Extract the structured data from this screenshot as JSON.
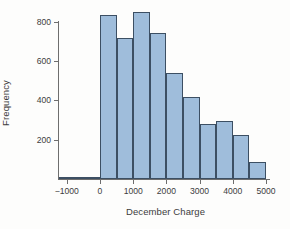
{
  "chart_data": {
    "type": "bar",
    "title": "",
    "subtitle": "",
    "xlabel": "December Charge",
    "ylabel": "Frequency",
    "xlim": [
      -1500,
      5200
    ],
    "ylim": [
      0,
      880
    ],
    "grid": false,
    "legend": null,
    "bin_width": 500,
    "xticks": [
      -1000,
      0,
      1000,
      2000,
      3000,
      4000,
      5000
    ],
    "xtick_labels": [
      "−1000",
      "0",
      "1000",
      "2000",
      "3000",
      "4000",
      "5000"
    ],
    "yticks": [
      200,
      400,
      600,
      800
    ],
    "ytick_labels": [
      "200",
      "400",
      "600",
      "800"
    ],
    "bin_edges": [
      -1250,
      -750,
      -250,
      0,
      500,
      1000,
      1500,
      2000,
      2500,
      3000,
      3500,
      4000,
      4500,
      5000
    ],
    "bars": [
      {
        "x0": -1250,
        "x1": -750,
        "value": 2
      },
      {
        "x0": -750,
        "x1": -250,
        "value": 3
      },
      {
        "x0": -250,
        "x1": 0,
        "value": 4
      },
      {
        "x0": 0,
        "x1": 500,
        "value": 835
      },
      {
        "x0": 500,
        "x1": 1000,
        "value": 715
      },
      {
        "x0": 1000,
        "x1": 1500,
        "value": 850
      },
      {
        "x0": 1500,
        "x1": 2000,
        "value": 740
      },
      {
        "x0": 2000,
        "x1": 2500,
        "value": 540
      },
      {
        "x0": 2500,
        "x1": 3000,
        "value": 415
      },
      {
        "x0": 3000,
        "x1": 3500,
        "value": 280
      },
      {
        "x0": 3500,
        "x1": 4000,
        "value": 295
      },
      {
        "x0": 4000,
        "x1": 4500,
        "value": 222
      },
      {
        "x0": 4500,
        "x1": 5000,
        "value": 85
      }
    ],
    "categories": [
      "-1250..-750",
      "-750..-250",
      "-250..0",
      "0..500",
      "500..1000",
      "1000..1500",
      "1500..2000",
      "2000..2500",
      "2500..3000",
      "3000..3500",
      "3500..4000",
      "4000..4500",
      "4500..5000"
    ],
    "values": [
      2,
      3,
      4,
      835,
      715,
      850,
      740,
      540,
      415,
      280,
      295,
      222,
      85
    ],
    "colors": {
      "bar_fill": "#9fbddb",
      "bar_edge": "#3c4f63",
      "axis": "#6e6e6e",
      "text": "#3c3c3c",
      "background": "#fdfdfc"
    }
  }
}
